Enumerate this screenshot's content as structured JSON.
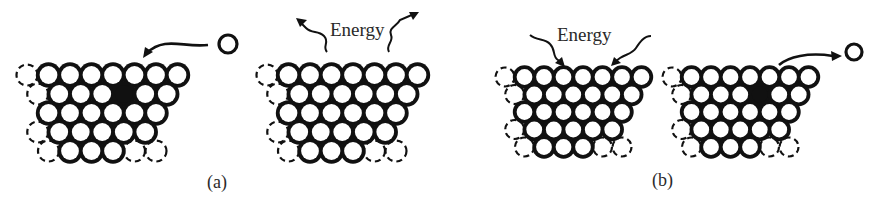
{
  "figure": {
    "panels": [
      {
        "id": "a",
        "label": "(a)",
        "description": "An atom is absorbed into a vacancy in the crystal lattice; energy is released.",
        "left_lattice": {
          "vacancy": true,
          "free_atom": "incoming",
          "arrow": "toward-lattice"
        },
        "right_lattice": {
          "vacancy": false,
          "energy_text": "Energy",
          "energy_direction": "out"
        }
      },
      {
        "id": "b",
        "label": "(b)",
        "description": "Energy is absorbed by the crystal lattice, creating a vacancy as an atom leaves.",
        "left_lattice": {
          "vacancy": false,
          "energy_text": "Energy",
          "energy_direction": "in"
        },
        "right_lattice": {
          "vacancy": true,
          "free_atom": "outgoing",
          "arrow": "away-from-lattice"
        }
      }
    ],
    "energy_label": "Energy",
    "colors": {
      "ink": "#111111",
      "background": "#ffffff"
    }
  }
}
